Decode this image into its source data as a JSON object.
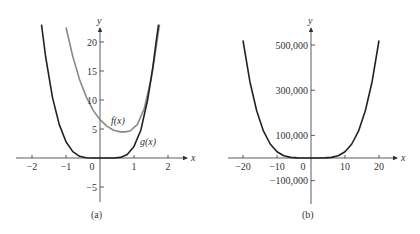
{
  "chart_data": [
    {
      "type": "line",
      "panel_label": "(a)",
      "xlabel": "x",
      "ylabel": "y",
      "xlim": [
        -2.4,
        2.6
      ],
      "ylim": [
        -8,
        23
      ],
      "x_ticks": [
        "-2",
        "-1",
        "0",
        "1",
        "2"
      ],
      "y_ticks": [
        "20",
        "15",
        "10",
        "5",
        "-5"
      ],
      "series": [
        {
          "name": "f(x)",
          "color": "#8a8a8a",
          "x": [
            -1.0,
            -0.8,
            -0.6,
            -0.4,
            -0.2,
            0.0,
            0.2,
            0.4,
            0.6,
            0.75,
            0.9,
            1.1,
            1.3,
            1.5,
            1.6,
            1.7,
            1.75
          ],
          "y": [
            22.5,
            17.5,
            13.5,
            10.5,
            8.2,
            6.6,
            5.5,
            4.8,
            4.5,
            4.5,
            4.7,
            5.8,
            8.5,
            13.5,
            17.0,
            21.0,
            23.0
          ]
        },
        {
          "name": "g(x)",
          "color": "#222222",
          "x": [
            -1.72,
            -1.6,
            -1.4,
            -1.2,
            -1.0,
            -0.8,
            -0.6,
            -0.4,
            -0.2,
            0.0,
            0.2,
            0.4,
            0.6,
            0.8,
            1.0,
            1.2,
            1.4,
            1.55,
            1.65,
            1.72
          ],
          "y": [
            23.0,
            17.5,
            10.5,
            5.8,
            2.8,
            1.1,
            0.3,
            0.05,
            0.0,
            0.0,
            0.0,
            0.0,
            0.1,
            0.6,
            2.0,
            4.8,
            10.0,
            15.5,
            20.0,
            23.0
          ]
        }
      ],
      "annotations": [
        "f(x)",
        "g(x)"
      ]
    },
    {
      "type": "line",
      "panel_label": "(b)",
      "xlabel": "x",
      "ylabel": "y",
      "xlim": [
        -24,
        24
      ],
      "ylim": [
        -150000,
        560000
      ],
      "x_ticks": [
        "-20",
        "-10",
        "0",
        "10",
        "20"
      ],
      "y_ticks": [
        "500,000",
        "300,000",
        "100,000",
        "-100,000"
      ],
      "series": [
        {
          "name": "curve",
          "color": "#222222",
          "x": [
            -20,
            -18,
            -16,
            -14,
            -12,
            -10,
            -8,
            -6,
            -4,
            -2,
            0,
            2,
            4,
            6,
            8,
            10,
            12,
            14,
            16,
            18,
            20
          ],
          "y": [
            520000,
            340000,
            210000,
            120000,
            62000,
            28000,
            10000,
            2500,
            300,
            0,
            0,
            0,
            300,
            2500,
            10000,
            28000,
            62000,
            120000,
            210000,
            340000,
            520000
          ]
        }
      ]
    }
  ],
  "panels": {
    "a": {
      "label": "(a)",
      "x_axis": "x",
      "y_axis": "y",
      "f_label": "f(x)",
      "g_label": "g(x)",
      "x_ticks": [
        "−2",
        "−1",
        "0",
        "1",
        "2"
      ],
      "y_ticks": [
        "20",
        "15",
        "10",
        "5",
        "−5"
      ]
    },
    "b": {
      "label": "(b)",
      "x_axis": "x",
      "y_axis": "y",
      "x_ticks": [
        "−20",
        "−10",
        "0",
        "10",
        "20"
      ],
      "y_ticks": [
        "500,000",
        "300,000",
        "100,000",
        "−100,000"
      ]
    }
  }
}
